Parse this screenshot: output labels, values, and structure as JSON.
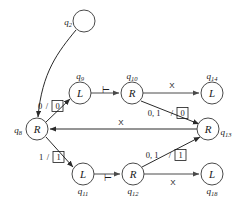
{
  "diagram": {
    "nodes": [
      {
        "id": "q2",
        "state_label": "q",
        "state_sub": "2",
        "letter": "",
        "cx": 84,
        "cy": 21,
        "r": 11,
        "label_x": 68,
        "label_y": 22
      },
      {
        "id": "q8",
        "state_label": "q",
        "state_sub": "8",
        "letter": "R",
        "cx": 37,
        "cy": 129,
        "r": 11,
        "label_x": 18,
        "label_y": 130
      },
      {
        "id": "q9",
        "state_label": "q",
        "state_sub": "9",
        "letter": "L",
        "cx": 80,
        "cy": 93,
        "r": 11,
        "label_x": 80,
        "label_y": 76
      },
      {
        "id": "q10",
        "state_label": "q",
        "state_sub": "10",
        "letter": "R",
        "cx": 132,
        "cy": 93,
        "r": 11,
        "label_x": 132,
        "label_y": 76
      },
      {
        "id": "q14",
        "state_label": "q",
        "state_sub": "14",
        "letter": "L",
        "cx": 212,
        "cy": 93,
        "r": 11,
        "label_x": 212,
        "label_y": 76
      },
      {
        "id": "q13",
        "state_label": "q",
        "state_sub": "13",
        "letter": "R",
        "cx": 208,
        "cy": 129,
        "r": 11,
        "label_x": 225,
        "label_y": 132
      },
      {
        "id": "q11",
        "state_label": "q",
        "state_sub": "11",
        "letter": "L",
        "cx": 83,
        "cy": 174,
        "r": 11,
        "label_x": 83,
        "label_y": 191
      },
      {
        "id": "q12",
        "state_label": "q",
        "state_sub": "12",
        "letter": "R",
        "cx": 133,
        "cy": 174,
        "r": 11,
        "label_x": 133,
        "label_y": 191
      },
      {
        "id": "q18",
        "state_label": "q",
        "state_sub": "18",
        "letter": "L",
        "cx": 212,
        "cy": 174,
        "r": 11,
        "label_x": 212,
        "label_y": 191
      }
    ],
    "edges": [
      {
        "id": "e-q2-q8",
        "from": "q2",
        "to": "q8",
        "label_read": "0",
        "label_write": "0",
        "boxed": true,
        "lx": 47,
        "ly": 106
      },
      {
        "id": "e-q8-q9",
        "from": "q8",
        "to": "q9",
        "label_read": "",
        "label_write": "",
        "boxed": false,
        "lx": 0,
        "ly": 0
      },
      {
        "id": "e-q9-q10",
        "from": "q9",
        "to": "q10",
        "label_read": "⊢",
        "label_write": "",
        "boxed": false,
        "lx": 106,
        "ly": 90
      },
      {
        "id": "e-q10-q14",
        "from": "q10",
        "to": "q14",
        "label_read": "X",
        "label_write": "",
        "boxed": false,
        "lx": 172,
        "ly": 86
      },
      {
        "id": "e-q10-q13",
        "from": "q10",
        "to": "q13",
        "label_read": "0, 1",
        "label_write": "0",
        "boxed": true,
        "lx": 172,
        "ly": 113
      },
      {
        "id": "e-q13-q8",
        "from": "q13",
        "to": "q8",
        "label_read": "X",
        "label_write": "",
        "boxed": false,
        "lx": 121,
        "ly": 123
      },
      {
        "id": "e-q8-q11",
        "from": "q8",
        "to": "q11",
        "label_read": "1",
        "label_write": "1",
        "boxed": true,
        "lx": 48,
        "ly": 157
      },
      {
        "id": "e-q11-q12",
        "from": "q11",
        "to": "q12",
        "label_read": "⊢",
        "label_write": "",
        "boxed": false,
        "lx": 108,
        "ly": 178
      },
      {
        "id": "e-q12-q13",
        "from": "q12",
        "to": "q13",
        "label_read": "0, 1",
        "label_write": "1",
        "boxed": true,
        "lx": 172,
        "ly": 155
      },
      {
        "id": "e-q12-q18",
        "from": "q12",
        "to": "q18",
        "label_read": "X",
        "label_write": "",
        "boxed": false,
        "lx": 173,
        "ly": 182
      }
    ],
    "labels": {
      "zero_write_box": "0",
      "one_write_box": "1",
      "turnstile": "⊢",
      "blank_x": "X",
      "zero_one": "0, 1",
      "read_zero": "0",
      "read_one": "1",
      "slash": "/"
    },
    "colors": {
      "background": "#ffffff",
      "stroke": "#4a4a4a",
      "stroke_dark": "#2a2a2a",
      "text": "#1a1a1a"
    }
  }
}
